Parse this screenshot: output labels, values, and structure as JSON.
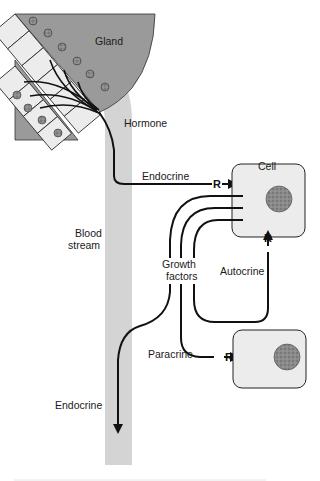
{
  "diagram": {
    "type": "signaling-pathways",
    "labels": {
      "gland": "Gland",
      "hormone": "Hormone",
      "endocrine_top": "Endocrine",
      "cell": "Cell",
      "blood_stream_line1": "Blood",
      "blood_stream_line2": "stream",
      "growth_factors_line1": "Growth",
      "growth_factors_line2": "factors",
      "autocrine": "Autocrine",
      "paracrine": "Paracrine",
      "endocrine_bottom": "Endocrine",
      "receptor": "R"
    },
    "nodes": [
      {
        "id": "gland",
        "label": "Gland"
      },
      {
        "id": "blood-stream",
        "label": "Blood stream"
      },
      {
        "id": "cell-1",
        "label": "Cell"
      },
      {
        "id": "cell-2",
        "label": ""
      }
    ],
    "edges": [
      {
        "from": "gland",
        "to": "cell-1",
        "label": "Endocrine",
        "via": "Hormone / Blood stream"
      },
      {
        "from": "cell-1",
        "to": "cell-1",
        "label": "Autocrine",
        "via": "Growth factors"
      },
      {
        "from": "cell-1",
        "to": "cell-2",
        "label": "Paracrine",
        "via": "Growth factors"
      },
      {
        "from": "cell-1",
        "to": "blood-stream",
        "label": "Endocrine",
        "via": "Growth factors"
      }
    ],
    "colors": {
      "gland_fill": "#9a9a9a",
      "gland_cell_fill": "#ececec",
      "blood_stream": "#d4d4d4",
      "cell_fill": "#ececec",
      "nucleus": "#7a7a7a",
      "stroke": "#111111"
    }
  }
}
